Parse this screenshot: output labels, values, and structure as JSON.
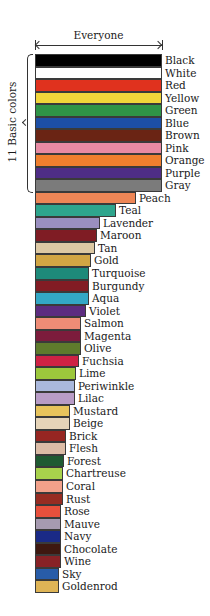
{
  "chart_data": {
    "type": "bar",
    "orientation": "horizontal",
    "title": "",
    "top_annotation": "Everyone",
    "group_annotation": "11 Basic colors",
    "xlabel": "",
    "ylabel": "",
    "grid": false,
    "legend": null,
    "value_units": "relative bar length (px, approx)",
    "categories": [
      "Black",
      "White",
      "Red",
      "Yellow",
      "Green",
      "Blue",
      "Brown",
      "Pink",
      "Orange",
      "Purple",
      "Gray",
      "Peach",
      "Teal",
      "Lavender",
      "Maroon",
      "Tan",
      "Gold",
      "Turquoise",
      "Burgundy",
      "Aqua",
      "Violet",
      "Salmon",
      "Magenta",
      "Olive",
      "Fuchsia",
      "Lime",
      "Periwinkle",
      "Lilac",
      "Mustard",
      "Beige",
      "Brick",
      "Flesh",
      "Forest",
      "Chartreuse",
      "Coral",
      "Rust",
      "Rose",
      "Mauve",
      "Navy",
      "Chocolate",
      "Wine",
      "Sky",
      "Goldenrod"
    ],
    "values": [
      127,
      127,
      127,
      127,
      127,
      127,
      127,
      127,
      127,
      127,
      127,
      101,
      81,
      65,
      62,
      60,
      56,
      54,
      54,
      54,
      51,
      46,
      46,
      46,
      44,
      41,
      40,
      40,
      35,
      35,
      31,
      31,
      29,
      28,
      28,
      28,
      26,
      26,
      26,
      26,
      26,
      24,
      24
    ],
    "colors": [
      "#000000",
      "#ffffff",
      "#e0321e",
      "#f2d63a",
      "#2f9447",
      "#1d4fa6",
      "#6a2414",
      "#e88aa3",
      "#ef7f2e",
      "#4e2d86",
      "#7b7b7b",
      "#ee8656",
      "#2ea58d",
      "#9a8fc0",
      "#7f1c24",
      "#ddc9a4",
      "#d2a644",
      "#1e8a7a",
      "#821c24",
      "#33a8c6",
      "#5c2c80",
      "#ee8c76",
      "#7c1c3c",
      "#5f7b2c",
      "#cf2344",
      "#9cc83c",
      "#aab8dc",
      "#b89cc6",
      "#e8c45c",
      "#e6d4b8",
      "#962622",
      "#dcbca6",
      "#1f5a32",
      "#a8d24c",
      "#f2a18a",
      "#962c22",
      "#e8503c",
      "#a69ab0",
      "#1a2a86",
      "#3e1810",
      "#882226",
      "#285ca8",
      "#deb456"
    ]
  }
}
